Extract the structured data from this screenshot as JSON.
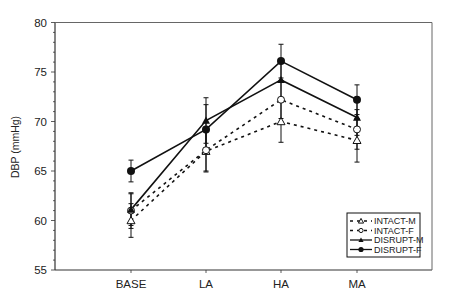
{
  "chart_data": {
    "type": "line",
    "title": "",
    "xlabel": "",
    "ylabel": "DBP (mmHg)",
    "categories": [
      "BASE",
      "LA",
      "HA",
      "MA"
    ],
    "ylim": [
      55,
      80
    ],
    "yticks": [
      55,
      60,
      65,
      70,
      75,
      80
    ],
    "y_minor_step": 1,
    "grid": false,
    "legend_position": "lower right",
    "series": [
      {
        "name": "INTACT-M",
        "values": [
          60.0,
          67.0,
          70.0,
          68.1
        ],
        "errors": [
          1.7,
          2.0,
          2.1,
          2.2
        ],
        "line_style": "dashed",
        "marker": "open-triangle"
      },
      {
        "name": "INTACT-F",
        "values": [
          61.0,
          67.1,
          72.2,
          69.2
        ],
        "errors": [
          1.8,
          2.2,
          1.9,
          2.0
        ],
        "line_style": "dashed",
        "marker": "open-circle"
      },
      {
        "name": "DISRUPT-M",
        "values": [
          61.1,
          70.1,
          74.2,
          70.4
        ],
        "errors": [
          1.6,
          2.3,
          1.8,
          1.8
        ],
        "line_style": "solid",
        "marker": "filled-triangle"
      },
      {
        "name": "DISRUPT-F",
        "values": [
          65.0,
          69.2,
          76.1,
          72.2
        ],
        "errors": [
          1.1,
          2.5,
          1.7,
          1.5
        ],
        "line_style": "solid",
        "marker": "filled-circle"
      }
    ]
  },
  "colors": {
    "ink": "#111111",
    "axis": "#333333",
    "background": "#ffffff"
  }
}
